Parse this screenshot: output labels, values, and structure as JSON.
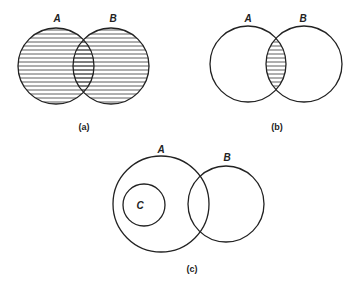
{
  "figure": {
    "panels": [
      {
        "id": "a",
        "caption": "(a)",
        "description": "Union of A and B shaded",
        "shaded_region": "A ∪ B",
        "sets": [
          {
            "label": "A",
            "cx": 56,
            "cy": 66,
            "r": 38
          },
          {
            "label": "B",
            "cx": 111,
            "cy": 66,
            "r": 38
          }
        ]
      },
      {
        "id": "b",
        "caption": "(b)",
        "description": "Intersection of A and B shaded",
        "shaded_region": "A ∩ B",
        "sets": [
          {
            "label": "A",
            "cx": 248,
            "cy": 64,
            "r": 38
          },
          {
            "label": "B",
            "cx": 304,
            "cy": 64,
            "r": 38
          }
        ]
      },
      {
        "id": "c",
        "caption": "(c)",
        "description": "C is a subset of A; A and B overlap; C disjoint from B",
        "shaded_region": "none",
        "sets": [
          {
            "label": "A",
            "cx": 161,
            "cy": 204,
            "r": 48
          },
          {
            "label": "B",
            "cx": 226,
            "cy": 204,
            "r": 38
          },
          {
            "label": "C",
            "cx": 144,
            "cy": 205,
            "r": 21
          }
        ]
      }
    ],
    "colors": {
      "stroke": "#222222",
      "hatch": "#333333",
      "background": "#ffffff"
    }
  }
}
